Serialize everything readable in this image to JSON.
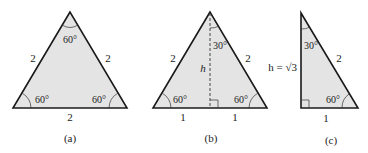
{
  "figures": [
    {
      "id": "a",
      "caption": "(a)",
      "side_left": "2",
      "side_right": "2",
      "side_bottom": "2",
      "angle_top": "60°",
      "angle_left": "60°",
      "angle_right": "60°"
    },
    {
      "id": "b",
      "caption": "(b)",
      "side_left": "2",
      "side_right": "2",
      "height_label": "h",
      "base_left": "1",
      "base_right": "1",
      "angle_top": "30°",
      "angle_left": "60°",
      "angle_right": "60°"
    },
    {
      "id": "c",
      "caption": "(c)",
      "height_label": "h = √3",
      "hypotenuse": "2",
      "base": "1",
      "angle_top": "30°",
      "angle_right": "60°"
    }
  ],
  "colors": {
    "fill": "#e4e4e4",
    "stroke": "#1a1a1a"
  }
}
